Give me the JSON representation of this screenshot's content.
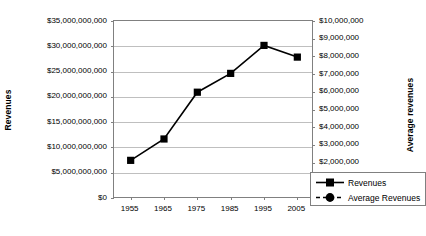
{
  "chart_data": {
    "type": "line",
    "title": "",
    "xlabel": "",
    "categories": [
      "1955",
      "1965",
      "1975",
      "1985",
      "1995",
      "2005"
    ],
    "x": [
      1955,
      1965,
      1975,
      1985,
      1995,
      2005
    ],
    "grid": true,
    "legend_position": "inside-bottom-right",
    "series": [
      {
        "name": "Revenues",
        "axis": "left",
        "marker": "square",
        "line_style": "solid",
        "color": "#000000",
        "values": [
          7600000000,
          11800000000,
          21000000000,
          24700000000,
          30200000000,
          27900000000
        ]
      },
      {
        "name": "Average Revenues",
        "axis": "right",
        "marker": "circle",
        "line_style": "dashed",
        "color": "#000000",
        "values": [
          3000000000,
          4500000000,
          8700000000,
          7000000000,
          5700000000,
          4800000000
        ]
      }
    ],
    "y_left": {
      "label": "Revenues",
      "ylim": [
        0,
        35000000000
      ],
      "step": 5000000000,
      "ticks": [
        "$35,000,000,000",
        "$30,000,000,000",
        "$25,000,000,000",
        "$20,000,000,000",
        "$15,000,000,000",
        "$10,000,000,000",
        "$5,000,000,000",
        "$0"
      ]
    },
    "y_right": {
      "label": "Average revenues",
      "ylim": [
        0,
        10000000
      ],
      "step": 1000000,
      "ticks": [
        "$10,000,000",
        "$9,000,000",
        "$8,000,000",
        "$7,000,000",
        "$6,000,000",
        "$5,000,000",
        "$4,000,000",
        "$3,000,000",
        "$2,000,000",
        "$1,000,000",
        "$0"
      ]
    },
    "legend": {
      "items": [
        {
          "label": "Revenues"
        },
        {
          "label": "Average Revenues"
        }
      ]
    }
  }
}
